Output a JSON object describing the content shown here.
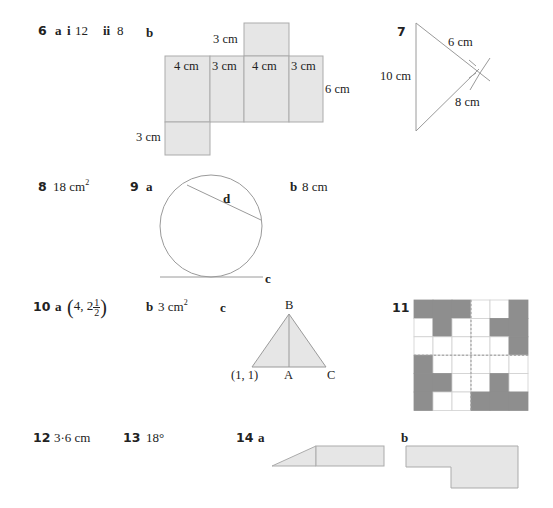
{
  "answers": {
    "q6": {
      "number": "6",
      "part_a": "a",
      "part_a_i": "i",
      "part_a_i_value": "12",
      "part_a_ii": "ii",
      "part_a_ii_value": "8",
      "part_b": "b",
      "net_labels": {
        "top_side": "3 cm",
        "faces": [
          "4 cm",
          "3 cm",
          "4 cm",
          "3 cm"
        ],
        "height": "6 cm",
        "bottom_side": "3 cm"
      }
    },
    "q7": {
      "number": "7",
      "side_left": "10 cm",
      "side_upper": "6 cm",
      "side_lower": "8 cm"
    },
    "q8": {
      "number": "8",
      "value": "18 cm",
      "value_sup": "2"
    },
    "q9": {
      "number": "9",
      "part_a": "a",
      "chord_label": "d",
      "tangent_label": "c",
      "part_b": "b",
      "part_b_value": "8 cm"
    },
    "q10": {
      "number": "10",
      "part_a": "a",
      "part_a_paren_open": "(",
      "part_a_value": "4, 2",
      "part_a_frac_num": "1",
      "part_a_frac_den": "2",
      "part_a_paren_close": ")",
      "part_b": "b",
      "part_b_value": "3 cm",
      "part_b_sup": "2",
      "part_c": "c",
      "triangle_labels": {
        "apex": "B",
        "left": "(1, 1)",
        "mid": "A",
        "right": "C"
      }
    },
    "q11": {
      "number": "11",
      "grid_rows": [
        [
          1,
          1,
          1,
          0,
          0,
          1
        ],
        [
          0,
          1,
          0,
          0,
          1,
          1
        ],
        [
          0,
          0,
          0,
          0,
          0,
          1
        ],
        [
          1,
          0,
          0,
          0,
          0,
          0
        ],
        [
          1,
          1,
          0,
          0,
          1,
          0
        ],
        [
          1,
          0,
          0,
          1,
          1,
          1
        ]
      ]
    },
    "q12": {
      "number": "12",
      "value": "3·6 cm"
    },
    "q13": {
      "number": "13",
      "value": "18°"
    },
    "q14": {
      "number": "14",
      "part_a": "a",
      "part_b": "b"
    }
  },
  "colors": {
    "shape_fill": "#e6e6e6",
    "shape_stroke": "#ababab",
    "grid_dark": "#8e8e8e",
    "line": "#9a9a9a"
  }
}
